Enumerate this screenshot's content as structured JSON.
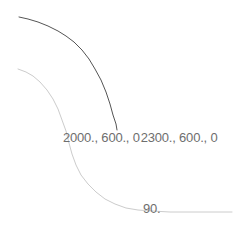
{
  "viewport": {
    "background_color": "#ffffff",
    "width": 245,
    "height": 235
  },
  "annotations": {
    "point_a_label": "2000., 600., 0",
    "point_b_label": "2300., 600., 0",
    "isoline_label": "90.",
    "text_color": "#6e6e6e"
  },
  "chart_data": {
    "type": "line",
    "title": "",
    "xlabel": "",
    "ylabel": "",
    "grid": false,
    "legend_position": "none",
    "annotations": [
      {
        "name": "point-a",
        "text": "2000., 600., 0",
        "x": 2000,
        "y": 600,
        "z": 0
      },
      {
        "name": "point-b",
        "text": "2300., 600., 0",
        "x": 2300,
        "y": 600,
        "z": 0
      },
      {
        "name": "isoline-value",
        "text": "90.",
        "value": 90
      }
    ],
    "series": [
      {
        "name": "upper-contour",
        "color": "#555555",
        "line_width": 1,
        "points": [
          [
            19,
            17
          ],
          [
            28,
            19
          ],
          [
            38,
            22
          ],
          [
            48,
            26
          ],
          [
            58,
            31
          ],
          [
            66,
            36
          ],
          [
            74,
            42
          ],
          [
            82,
            50
          ],
          [
            89,
            59
          ],
          [
            95,
            69
          ],
          [
            101,
            80
          ],
          [
            106,
            92
          ],
          [
            110,
            104
          ],
          [
            113,
            115
          ],
          [
            116,
            124
          ],
          [
            117,
            130
          ]
        ]
      },
      {
        "name": "lower-contour",
        "color": "#cccccc",
        "line_width": 1,
        "points": [
          [
            18,
            69
          ],
          [
            26,
            72
          ],
          [
            33,
            76
          ],
          [
            40,
            82
          ],
          [
            47,
            90
          ],
          [
            53,
            99
          ],
          [
            58,
            109
          ],
          [
            62,
            120
          ],
          [
            66,
            131
          ],
          [
            69,
            143
          ],
          [
            72,
            154
          ],
          [
            76,
            165
          ],
          [
            81,
            175
          ],
          [
            88,
            184
          ],
          [
            96,
            192
          ],
          [
            105,
            199
          ],
          [
            115,
            204
          ],
          [
            126,
            208
          ],
          [
            138,
            210
          ],
          [
            152,
            211
          ],
          [
            170,
            212
          ],
          [
            195,
            212
          ],
          [
            215,
            212
          ],
          [
            232,
            212
          ]
        ]
      }
    ]
  }
}
